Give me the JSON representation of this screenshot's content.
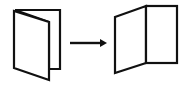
{
  "diagram": {
    "description": "Folded booklet opening into an unfolded booklet",
    "stroke_color": "#111111",
    "background": "#ffffff",
    "nodes": [
      {
        "id": "closed-booklet",
        "label": "Closed folded booklet"
      },
      {
        "id": "open-booklet",
        "label": "Opened booklet"
      }
    ],
    "edges": [
      {
        "from": "closed-booklet",
        "to": "open-booklet",
        "type": "arrow"
      }
    ]
  }
}
